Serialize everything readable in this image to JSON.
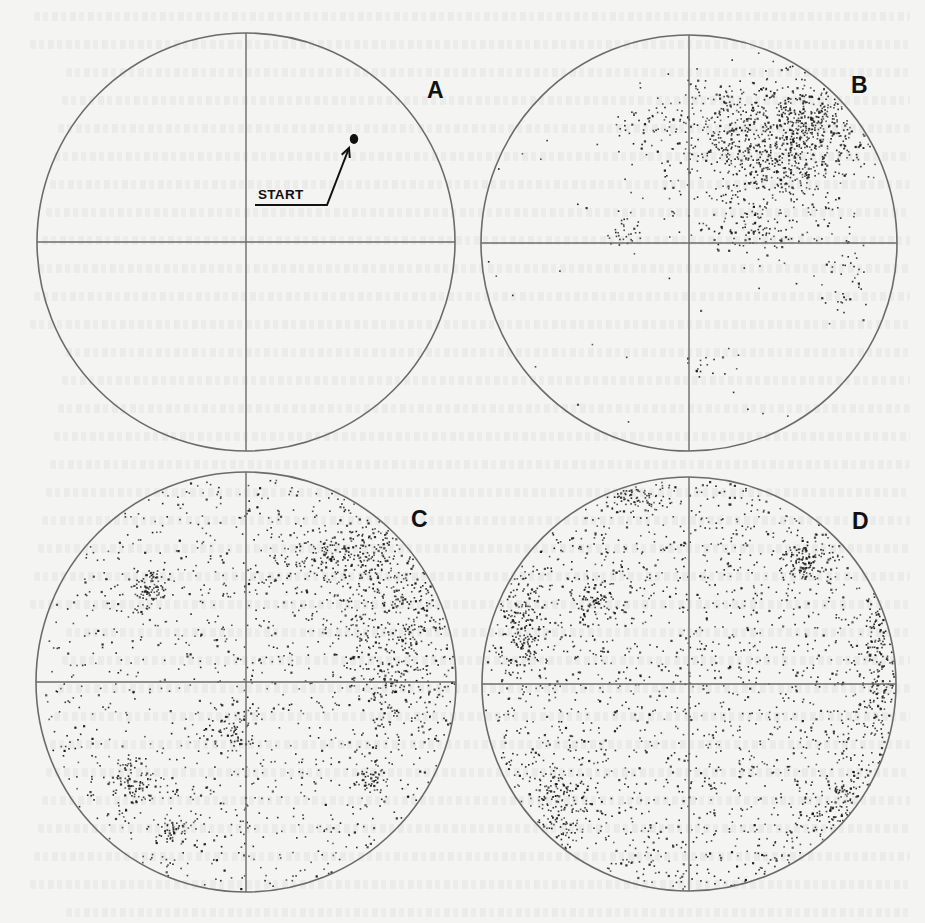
{
  "figure": {
    "colors": {
      "background": "#f4f4f2",
      "circle_stroke": "#6b6b6b",
      "axis_stroke": "#6b6b6b",
      "point": "#1a1a1a"
    },
    "panels": [
      {
        "id": "A",
        "label": "A",
        "center": [
          246,
          242
        ],
        "radius": 209,
        "label_pos": [
          427,
          79
        ],
        "start_marker": {
          "label": "START",
          "dot": [
            354,
            139
          ],
          "label_pos": [
            258,
            188
          ],
          "underline": [
            [
              255,
              205
            ],
            [
              327,
              205
            ]
          ],
          "arrow_to": [
            349,
            148
          ]
        },
        "point_count": 0,
        "clusters": []
      },
      {
        "id": "B",
        "label": "B",
        "center": [
          689,
          243
        ],
        "radius": 208,
        "label_pos": [
          851,
          74
        ],
        "point_count": 1400,
        "background_density": 0.04,
        "clusters": [
          {
            "cx": 0.55,
            "cy": -0.55,
            "sx": 0.17,
            "sy": 0.14,
            "w": 0.4
          },
          {
            "cx": 0.35,
            "cy": -0.35,
            "sx": 0.22,
            "sy": 0.18,
            "w": 0.25
          },
          {
            "cx": 0.15,
            "cy": -0.6,
            "sx": 0.12,
            "sy": 0.1,
            "w": 0.1
          },
          {
            "cx": 0.3,
            "cy": -0.05,
            "sx": 0.12,
            "sy": 0.05,
            "w": 0.06
          },
          {
            "cx": -0.2,
            "cy": -0.55,
            "sx": 0.1,
            "sy": 0.08,
            "w": 0.04
          },
          {
            "cx": -0.3,
            "cy": -0.08,
            "sx": 0.04,
            "sy": 0.04,
            "w": 0.02
          },
          {
            "cx": 0.75,
            "cy": 0.2,
            "sx": 0.06,
            "sy": 0.1,
            "w": 0.03
          },
          {
            "cx": 0.1,
            "cy": 0.6,
            "sx": 0.06,
            "sy": 0.03,
            "w": 0.01
          }
        ]
      },
      {
        "id": "C",
        "label": "C",
        "center": [
          246,
          682
        ],
        "radius": 210,
        "label_pos": [
          411,
          508
        ],
        "point_count": 2200,
        "background_density": 0.55,
        "clusters": [
          {
            "cx": 0.72,
            "cy": -0.25,
            "sx": 0.14,
            "sy": 0.3,
            "w": 0.2
          },
          {
            "cx": 0.45,
            "cy": -0.62,
            "sx": 0.18,
            "sy": 0.1,
            "w": 0.08
          },
          {
            "cx": -0.45,
            "cy": -0.45,
            "sx": 0.05,
            "sy": 0.05,
            "w": 0.03
          },
          {
            "cx": -0.55,
            "cy": 0.45,
            "sx": 0.06,
            "sy": 0.06,
            "w": 0.03
          },
          {
            "cx": -0.05,
            "cy": 0.25,
            "sx": 0.05,
            "sy": 0.05,
            "w": 0.02
          },
          {
            "cx": 0.6,
            "cy": 0.45,
            "sx": 0.05,
            "sy": 0.05,
            "w": 0.02
          },
          {
            "cx": -0.35,
            "cy": 0.7,
            "sx": 0.05,
            "sy": 0.03,
            "w": 0.02
          }
        ]
      },
      {
        "id": "D",
        "label": "D",
        "center": [
          689,
          684
        ],
        "radius": 207,
        "label_pos": [
          852,
          510
        ],
        "point_count": 2600,
        "background_density": 0.7,
        "clusters": [
          {
            "cx": 0.9,
            "cy": -0.1,
            "sx": 0.05,
            "sy": 0.25,
            "w": 0.06
          },
          {
            "cx": 0.55,
            "cy": -0.6,
            "sx": 0.06,
            "sy": 0.05,
            "w": 0.03
          },
          {
            "cx": -0.8,
            "cy": -0.3,
            "sx": 0.06,
            "sy": 0.15,
            "w": 0.05
          },
          {
            "cx": -0.65,
            "cy": 0.55,
            "sx": 0.08,
            "sy": 0.12,
            "w": 0.04
          },
          {
            "cx": 0.75,
            "cy": 0.6,
            "sx": 0.1,
            "sy": 0.1,
            "w": 0.04
          },
          {
            "cx": -0.25,
            "cy": -0.9,
            "sx": 0.08,
            "sy": 0.03,
            "w": 0.02
          },
          {
            "cx": -0.45,
            "cy": -0.4,
            "sx": 0.05,
            "sy": 0.05,
            "w": 0.02
          }
        ]
      }
    ]
  }
}
